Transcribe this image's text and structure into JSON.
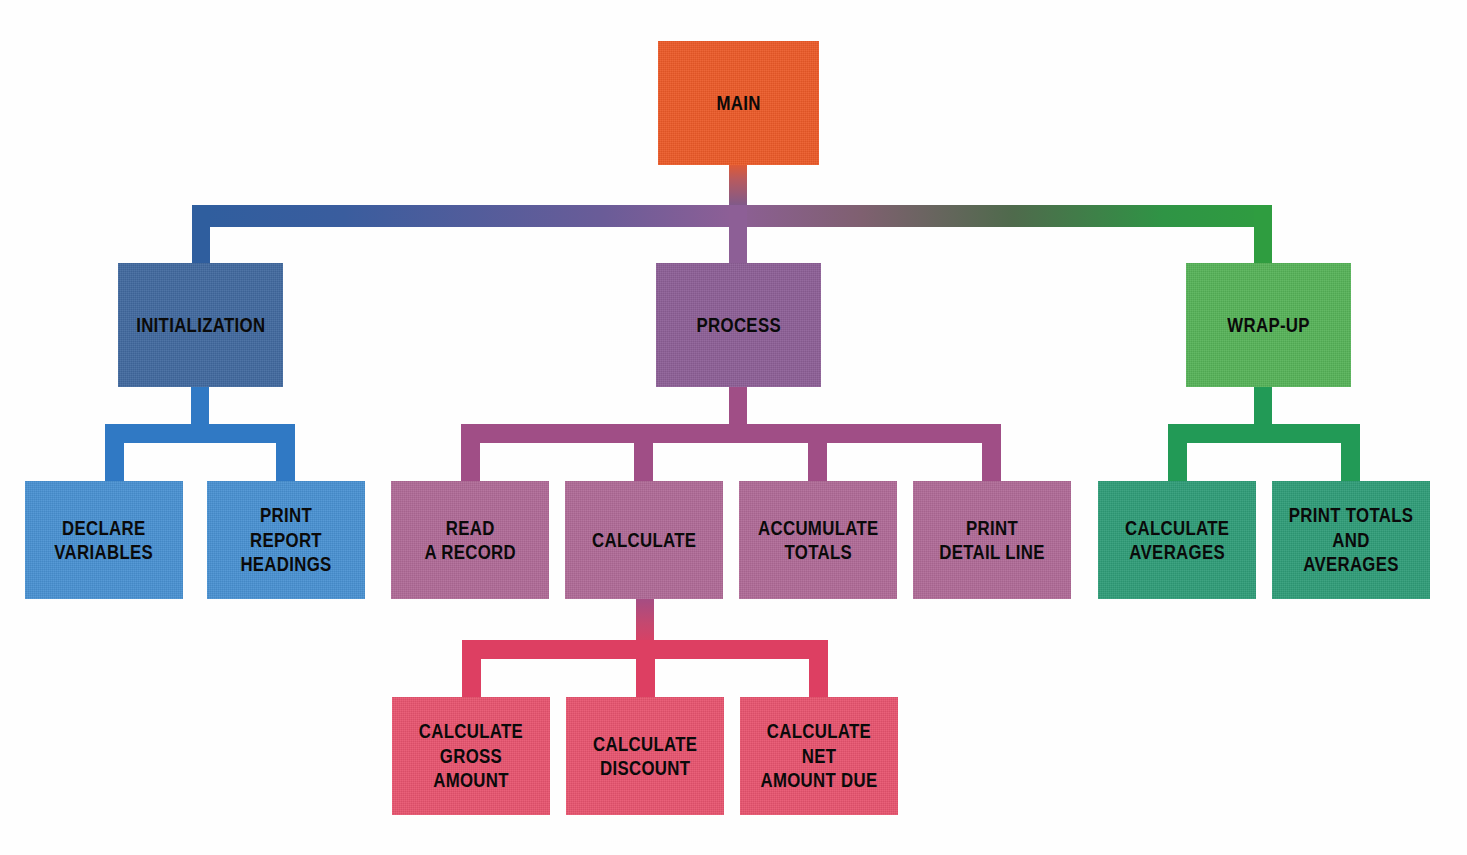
{
  "diagram": {
    "type": "hierarchy-chart",
    "background_color": "#fefefe",
    "palette": {
      "main": "#ec5a28",
      "initialization": "#41699f",
      "process": "#8d5f96",
      "wrapup": "#56b358",
      "init_children": "#4891d2",
      "process_children": "#b06a97",
      "wrapup_children": "#2f9d78",
      "calculate_children": "#e8546f",
      "text": "#0a0a0a"
    },
    "levels": [
      {
        "level": 1,
        "nodes": [
          {
            "id": "main",
            "label": "MAIN",
            "color": "#ec5a28"
          }
        ]
      },
      {
        "level": 2,
        "nodes": [
          {
            "id": "initialization",
            "label": "INITIALIZATION",
            "color": "#41699f",
            "parent": "main"
          },
          {
            "id": "process",
            "label": "PROCESS",
            "color": "#8d5f96",
            "parent": "main"
          },
          {
            "id": "wrapup",
            "label": "WRAP-UP",
            "color": "#56b358",
            "parent": "main"
          }
        ]
      },
      {
        "level": 3,
        "nodes": [
          {
            "id": "declare-variables",
            "label": "DECLARE\nVARIABLES",
            "color": "#4891d2",
            "parent": "initialization"
          },
          {
            "id": "print-report-headings",
            "label": "PRINT REPORT\nHEADINGS",
            "color": "#4891d2",
            "parent": "initialization"
          },
          {
            "id": "read-a-record",
            "label": "READ\nA RECORD",
            "color": "#b06a97",
            "parent": "process"
          },
          {
            "id": "calculate",
            "label": "CALCULATE",
            "color": "#b06a97",
            "parent": "process"
          },
          {
            "id": "accumulate-totals",
            "label": "ACCUMULATE\nTOTALS",
            "color": "#b06a97",
            "parent": "process"
          },
          {
            "id": "print-detail-line",
            "label": "PRINT\nDETAIL LINE",
            "color": "#b06a97",
            "parent": "process"
          },
          {
            "id": "calculate-averages",
            "label": "CALCULATE\nAVERAGES",
            "color": "#2f9d78",
            "parent": "wrapup"
          },
          {
            "id": "print-totals-and-averages",
            "label": "PRINT TOTALS\nAND AVERAGES",
            "color": "#2f9d78",
            "parent": "wrapup"
          }
        ]
      },
      {
        "level": 4,
        "nodes": [
          {
            "id": "calculate-gross-amount",
            "label": "CALCULATE\nGROSS AMOUNT",
            "color": "#e8546f",
            "parent": "calculate"
          },
          {
            "id": "calculate-discount",
            "label": "CALCULATE\nDISCOUNT",
            "color": "#e8546f",
            "parent": "calculate"
          },
          {
            "id": "calculate-net-amount-due",
            "label": "CALCULATE  NET\nAMOUNT DUE",
            "color": "#e8546f",
            "parent": "calculate"
          }
        ]
      }
    ],
    "connectors": {
      "main_to_level2_gradient": [
        "#2f5e9e",
        "#8d5f96",
        "#4a6a4a",
        "#2f9d40"
      ],
      "initialization_branch_color": "#3079c4",
      "process_branch_color": "#a04e86",
      "wrapup_branch_color": "#229a56",
      "calculate_branch_color": "#dd3f62"
    }
  }
}
